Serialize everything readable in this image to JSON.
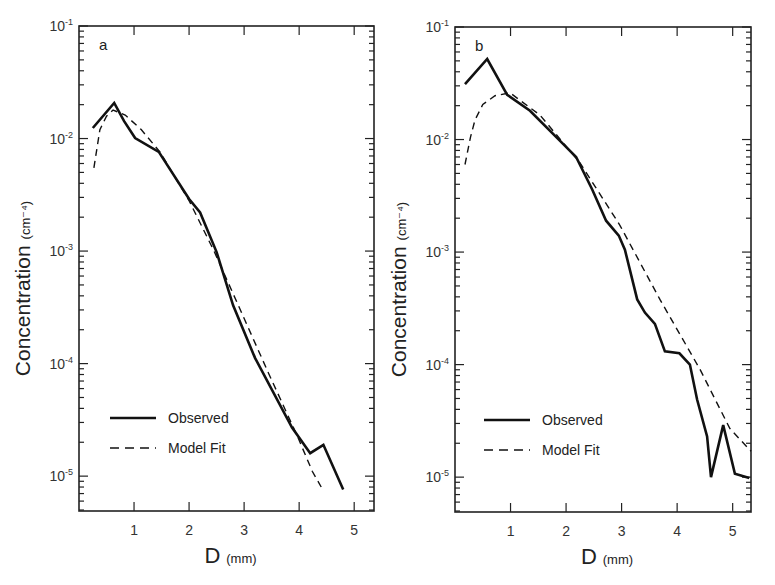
{
  "figure": {
    "panels_count": 2
  },
  "chart_data": [
    {
      "type": "line",
      "panel_label": "a",
      "title": "",
      "xlabel": "D",
      "xlabel_unit": "(mm)",
      "ylabel": "Concentration",
      "ylabel_unit": "(cm⁻⁴)",
      "yscale": "log",
      "xlim": [
        0,
        5.36
      ],
      "ylim": [
        4.9e-06,
        0.1
      ],
      "xticks": [
        1,
        2,
        3,
        4,
        5
      ],
      "xtick_labels": [
        "1",
        "2",
        "3",
        "4",
        "5"
      ],
      "yticks": [
        0.1,
        0.01,
        0.001,
        0.0001,
        1e-05
      ],
      "ytick_labels": [
        {
          "base": "10",
          "exp": "-1"
        },
        {
          "base": "10",
          "exp": "-2"
        },
        {
          "base": "10",
          "exp": "-3"
        },
        {
          "base": "10",
          "exp": "-4"
        },
        {
          "base": "10",
          "exp": "-5"
        }
      ],
      "grid": false,
      "legend": {
        "position": "lower left",
        "entries": [
          "Observed",
          "Model Fit"
        ]
      },
      "series": [
        {
          "name": "Observed",
          "style": "solid",
          "x": [
            0.25,
            0.64,
            0.82,
            1.02,
            1.45,
            2.0,
            2.2,
            2.5,
            2.8,
            3.2,
            3.87,
            4.2,
            4.44,
            4.8
          ],
          "y": [
            0.0124,
            0.0207,
            0.0143,
            0.0101,
            0.0076,
            0.0029,
            0.0022,
            0.00098,
            0.00033,
            0.000112,
            2.7e-05,
            1.6e-05,
            1.9e-05,
            7.6e-06
          ]
        },
        {
          "name": "Model Fit",
          "style": "dashed",
          "x": [
            0.27,
            0.38,
            0.5,
            0.62,
            0.84,
            1.13,
            1.47,
            2.0,
            2.45,
            2.87,
            3.44,
            3.98,
            4.24,
            4.4
          ],
          "y": [
            0.0055,
            0.012,
            0.0158,
            0.0179,
            0.0162,
            0.012,
            0.0076,
            0.0028,
            0.00101,
            0.00035,
            8.3e-05,
            2.2e-05,
            1.1e-05,
            8e-06
          ]
        }
      ]
    },
    {
      "type": "line",
      "panel_label": "b",
      "title": "",
      "xlabel": "D",
      "xlabel_unit": "(mm)",
      "ylabel": "Concentration",
      "ylabel_unit": "(cm⁻⁴)",
      "yscale": "log",
      "xlim": [
        0,
        5.33
      ],
      "ylim": [
        4.9e-06,
        0.1
      ],
      "xticks": [
        1,
        2,
        3,
        4,
        5
      ],
      "xtick_labels": [
        "1",
        "2",
        "3",
        "4",
        "5"
      ],
      "yticks": [
        0.1,
        0.01,
        0.001,
        0.0001,
        1e-05
      ],
      "ytick_labels": [
        {
          "base": "10",
          "exp": "-1"
        },
        {
          "base": "10",
          "exp": "-2"
        },
        {
          "base": "10",
          "exp": "-3"
        },
        {
          "base": "10",
          "exp": "-4"
        },
        {
          "base": "10",
          "exp": "-5"
        }
      ],
      "grid": false,
      "legend": {
        "position": "lower left",
        "entries": [
          "Observed",
          "Model Fit"
        ]
      },
      "series": [
        {
          "name": "Observed",
          "style": "solid",
          "x": [
            0.18,
            0.58,
            0.94,
            1.35,
            1.96,
            2.18,
            2.47,
            2.72,
            2.95,
            3.06,
            3.28,
            3.42,
            3.6,
            3.78,
            4.04,
            4.23,
            4.36,
            4.54,
            4.61,
            4.83,
            5.04,
            5.3
          ],
          "y": [
            0.031,
            0.052,
            0.025,
            0.018,
            0.009,
            0.007,
            0.0036,
            0.0019,
            0.0014,
            0.00105,
            0.00038,
            0.00029,
            0.00023,
            0.000131,
            0.000126,
            0.0001,
            4.9e-05,
            2.3e-05,
            1e-05,
            2.9e-05,
            1.07e-05,
            9.8e-06
          ]
        },
        {
          "name": "Model Fit",
          "style": "dashed",
          "x": [
            0.18,
            0.28,
            0.36,
            0.5,
            0.72,
            0.99,
            1.53,
            2.25,
            2.97,
            3.69,
            4.41,
            4.95,
            5.33
          ],
          "y": [
            0.006,
            0.0105,
            0.0149,
            0.0205,
            0.0245,
            0.026,
            0.0165,
            0.0062,
            0.00173,
            0.00038,
            9.1e-05,
            2.7e-05,
            1.7e-05
          ]
        }
      ]
    }
  ],
  "caption_fragment": ""
}
